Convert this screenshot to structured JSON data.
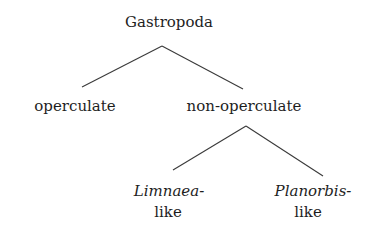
{
  "tree": {
    "root": {
      "label": "Gastropoda"
    },
    "level1": [
      {
        "label": "operculate"
      },
      {
        "label": "non-operculate"
      }
    ],
    "level2": [
      {
        "name_italic": "Limnaea-",
        "suffix": "like"
      },
      {
        "name_italic": "Planorbis-",
        "suffix": "like"
      }
    ]
  },
  "colors": {
    "text": "#1e1e1e",
    "lines": "#3a3a3a",
    "background": "#ffffff"
  }
}
